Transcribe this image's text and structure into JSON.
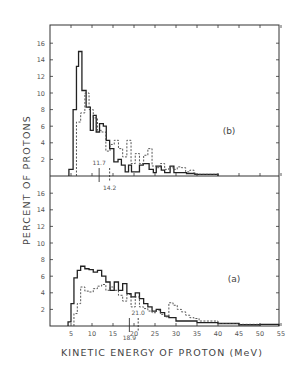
{
  "chart_data": [
    {
      "type": "histogram-step",
      "panel_label": "(b)",
      "xlabel": "KINETIC ENERGY OF PROTON (MeV)",
      "ylabel": "PERCENT OF PROTONS",
      "xlim": [
        0,
        55
      ],
      "ylim": [
        0,
        18
      ],
      "yticks": [
        2,
        4,
        6,
        8,
        10,
        12,
        14,
        16
      ],
      "series": [
        {
          "name": "solid",
          "style": "solid",
          "edges": [
            4.5,
            5.5,
            6.0,
            6.3,
            6.8,
            7.6,
            8.6,
            9.6,
            10.3,
            11.0,
            11.8,
            12.7,
            13.4,
            14.2,
            15.2,
            16.2,
            17.0,
            17.9,
            18.7,
            19.4,
            20.1,
            21.3,
            22.2,
            23.6,
            24.6,
            25.3,
            26.5,
            27.3,
            28.6,
            29.5,
            32.5,
            34.5,
            40.0
          ],
          "values": [
            0.8,
            8.0,
            8.0,
            13.2,
            15.0,
            10.3,
            8.3,
            5.5,
            7.3,
            5.3,
            6.3,
            6.0,
            4.3,
            3.3,
            1.7,
            2.0,
            1.3,
            0.5,
            1.3,
            0.5,
            0.5,
            1.3,
            1.5,
            0.8,
            0.4,
            1.2,
            0.7,
            0.4,
            1.2,
            0.4,
            0.3,
            0.2
          ]
        },
        {
          "name": "dashed",
          "style": "dashed",
          "edges": [
            6.3,
            7.3,
            8.3,
            9.3,
            10.3,
            11.3,
            12.3,
            13.3,
            14.3,
            15.3,
            16.3,
            17.3,
            18.3,
            19.3,
            20.3,
            21.3,
            22.3,
            23.3,
            24.3,
            25.3,
            26.3,
            27.3,
            28.3,
            29.3,
            30.3,
            31.3,
            32.3,
            33.3,
            34.3,
            36.3,
            40.0
          ],
          "values": [
            6.5,
            7.6,
            10.0,
            8.0,
            7.0,
            5.5,
            5.3,
            3.0,
            3.8,
            4.3,
            3.3,
            2.3,
            4.3,
            1.5,
            2.7,
            1.5,
            2.5,
            3.3,
            1.2,
            1.0,
            1.5,
            0.8,
            1.1,
            0.8,
            1.1,
            1.0,
            0.5,
            0.7,
            0.2,
            0.2
          ]
        }
      ],
      "annotations": [
        {
          "x": 11.7,
          "label": "11.7",
          "style": "solid"
        },
        {
          "x": 14.2,
          "label": "14.2",
          "style": "dashed"
        }
      ]
    },
    {
      "type": "histogram-step",
      "panel_label": "(a)",
      "xlabel": "KINETIC ENERGY OF PROTON (MeV)",
      "ylabel": "PERCENT OF PROTONS",
      "xlim": [
        0,
        55
      ],
      "ylim": [
        0,
        18
      ],
      "xticks": [
        5,
        10,
        15,
        20,
        25,
        30,
        35,
        40,
        45,
        50,
        55
      ],
      "yticks": [
        2,
        4,
        6,
        8,
        10,
        12,
        14,
        16
      ],
      "series": [
        {
          "name": "solid",
          "style": "solid",
          "edges": [
            4.3,
            5.0,
            5.7,
            6.5,
            7.3,
            8.3,
            9.3,
            10.3,
            11.3,
            12.3,
            13.3,
            14.3,
            15.3,
            16.3,
            17.3,
            18.3,
            19.3,
            20.3,
            21.3,
            22.3,
            23.3,
            24.3,
            25.3,
            26.3,
            27.3,
            28.3,
            30.0,
            35.0,
            40.0,
            45.0,
            50.0,
            54.5
          ],
          "values": [
            0.5,
            2.7,
            5.8,
            6.7,
            7.2,
            6.9,
            6.8,
            6.5,
            6.7,
            6.0,
            5.3,
            4.3,
            5.3,
            4.3,
            5.1,
            3.9,
            3.5,
            4.0,
            3.3,
            2.7,
            2.3,
            1.8,
            2.0,
            1.6,
            1.2,
            1.0,
            0.6,
            0.4,
            0.3,
            0.15,
            0.2
          ]
        },
        {
          "name": "dashed",
          "style": "dashed",
          "edges": [
            5.7,
            6.5,
            7.3,
            8.3,
            9.3,
            10.3,
            11.3,
            12.3,
            13.3,
            14.3,
            15.3,
            16.3,
            17.3,
            18.3,
            19.3,
            20.3,
            21.3,
            22.3,
            23.3,
            24.3,
            25.3,
            26.3,
            27.3,
            28.3,
            29.3,
            30.3,
            31.3,
            32.3,
            33.3,
            34.3,
            35.5,
            40.0,
            45.0,
            50.0
          ],
          "values": [
            1.5,
            2.7,
            4.7,
            4.2,
            4.1,
            4.5,
            4.8,
            5.0,
            4.3,
            4.7,
            4.3,
            3.7,
            3.0,
            3.8,
            2.3,
            3.5,
            2.3,
            2.1,
            1.8,
            1.6,
            1.9,
            1.4,
            1.1,
            2.8,
            2.5,
            2.0,
            1.7,
            1.3,
            1.0,
            0.9,
            0.6,
            0.3,
            0.2
          ]
        }
      ],
      "annotations": [
        {
          "x": 18.9,
          "label": "18.9",
          "style": "solid"
        },
        {
          "x": 21.0,
          "label": "21.0",
          "style": "dashed"
        }
      ]
    }
  ],
  "figure": {
    "ylabel": "PERCENT OF PROTONS",
    "xlabel": "KINETIC ENERGY OF PROTON (MeV)",
    "panel_b_label": "(b)",
    "panel_a_label": "(a)"
  }
}
